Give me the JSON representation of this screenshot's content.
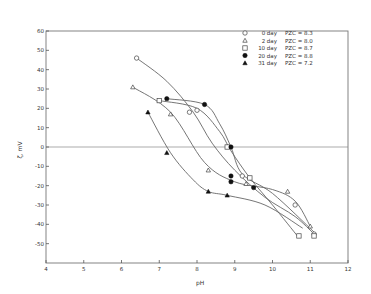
{
  "chart_data": {
    "type": "scatter",
    "title": "",
    "xlabel": "pH",
    "ylabel": "ζ, mV",
    "xlim": [
      4,
      12
    ],
    "ylim": [
      -60,
      60
    ],
    "xticks": [
      4,
      5,
      6,
      7,
      8,
      9,
      10,
      11,
      12
    ],
    "yticks": [
      60,
      50,
      40,
      30,
      20,
      10,
      0,
      -10,
      -20,
      -30,
      -40,
      -50
    ],
    "grid": false,
    "zero_line": true,
    "legend_position": "upper right",
    "series": [
      {
        "name": "0 day",
        "pzc_label": "PZC = 8.3",
        "marker": "open-circle",
        "x": [
          6.4,
          7.8,
          8.0,
          9.2,
          10.6,
          11.1
        ],
        "y": [
          46,
          18,
          19,
          -15,
          -30,
          -45
        ]
      },
      {
        "name": "2 day",
        "pzc_label": "PZC = 8.0",
        "marker": "open-triangle",
        "x": [
          6.3,
          7.3,
          8.3,
          9.3,
          10.4,
          11.0
        ],
        "y": [
          31,
          17,
          -12,
          -19,
          -23,
          -41
        ]
      },
      {
        "name": "10 day",
        "pzc_label": "PZC = 8.7",
        "marker": "open-square",
        "x": [
          7.0,
          8.8,
          9.4,
          10.7,
          11.1
        ],
        "y": [
          24,
          0,
          -16,
          -46,
          -46
        ]
      },
      {
        "name": "20 day",
        "pzc_label": "PZC = 8.8",
        "marker": "filled-circle",
        "x": [
          7.2,
          8.2,
          8.9,
          8.9,
          8.9,
          9.5
        ],
        "y": [
          25,
          22,
          0,
          -15,
          -18,
          -21
        ]
      },
      {
        "name": "31 day",
        "pzc_label": "PZC = 7.2",
        "marker": "filled-triangle",
        "x": [
          6.7,
          7.2,
          8.3,
          8.8
        ],
        "y": [
          18,
          -3,
          -23,
          -25
        ]
      }
    ],
    "curves": [
      {
        "series": "0 day",
        "points": [
          [
            6.4,
            46
          ],
          [
            7.2,
            34
          ],
          [
            7.9,
            18
          ],
          [
            8.4,
            2
          ],
          [
            9.0,
            -12
          ],
          [
            9.8,
            -26
          ],
          [
            10.6,
            -36
          ],
          [
            11.1,
            -45
          ]
        ]
      },
      {
        "series": "2 day",
        "points": [
          [
            6.3,
            31
          ],
          [
            7.3,
            18
          ],
          [
            8.2,
            -8
          ],
          [
            9.0,
            -18
          ],
          [
            10.0,
            -22
          ],
          [
            10.6,
            -28
          ],
          [
            11.0,
            -41
          ]
        ]
      },
      {
        "series": "10 day",
        "points": [
          [
            7.0,
            24
          ],
          [
            8.0,
            20
          ],
          [
            8.6,
            8
          ],
          [
            8.9,
            -2
          ],
          [
            9.4,
            -16
          ],
          [
            10.0,
            -30
          ],
          [
            10.7,
            -47
          ]
        ]
      },
      {
        "series": "20 day",
        "points": [
          [
            7.2,
            25
          ],
          [
            8.2,
            22
          ],
          [
            8.6,
            12
          ],
          [
            8.9,
            0
          ],
          [
            9.2,
            -14
          ],
          [
            10.0,
            -24
          ],
          [
            11.1,
            -44
          ]
        ]
      },
      {
        "series": "31 day",
        "points": [
          [
            6.7,
            18
          ],
          [
            7.3,
            -3
          ],
          [
            7.9,
            -17
          ],
          [
            8.3,
            -23
          ],
          [
            8.8,
            -25
          ],
          [
            9.8,
            -30
          ],
          [
            10.8,
            -42
          ]
        ]
      }
    ]
  },
  "legend": {
    "items": [
      {
        "label": "0 day",
        "pzc": "PZC = 8.3"
      },
      {
        "label": "2 day",
        "pzc": "PZC = 8.0"
      },
      {
        "label": "10 day",
        "pzc": "PZC = 8.7"
      },
      {
        "label": "20 day",
        "pzc": "PZC = 8.8"
      },
      {
        "label": "31 day",
        "pzc": "PZC = 7.2"
      }
    ]
  },
  "axes": {
    "x_label": "pH",
    "y_label": "ζ, mV",
    "x_ticks": [
      "4",
      "5",
      "6",
      "7",
      "8",
      "9",
      "10",
      "11",
      "12"
    ],
    "y_ticks": [
      "60",
      "50",
      "40",
      "30",
      "20",
      "10",
      "0",
      "-10",
      "-20",
      "-30",
      "-40",
      "-50"
    ]
  }
}
